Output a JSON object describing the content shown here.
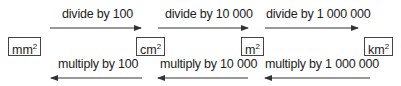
{
  "units": [
    {
      "base": "mm",
      "exp": "2"
    },
    {
      "base": "cm",
      "exp": "2"
    },
    {
      "base": "m",
      "exp": "2"
    },
    {
      "base": "km",
      "exp": "2"
    }
  ],
  "divide_labels": [
    "divide by 100",
    "divide by 10 000",
    "divide by 1 000 000"
  ],
  "multiply_labels": [
    "multiply by 100",
    "multiply by 10 000",
    "multiply by 1 000 000"
  ],
  "colors": {
    "line": "#333333",
    "text": "#222222"
  }
}
